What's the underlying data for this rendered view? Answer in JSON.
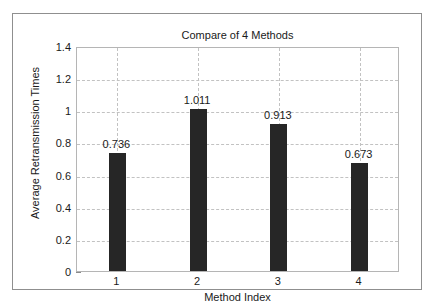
{
  "chart_data": {
    "type": "bar",
    "title": "Compare of 4 Methods",
    "xlabel": "Method Index",
    "ylabel": "Average Retransmission Times",
    "categories": [
      "1",
      "2",
      "3",
      "4"
    ],
    "values": [
      0.736,
      1.011,
      0.913,
      0.673
    ],
    "data_labels": [
      "0.736",
      "1.011",
      "0.913",
      "0.673"
    ],
    "ylim": [
      0,
      1.4
    ],
    "xlim": [
      0.5,
      4.5
    ],
    "ytick_labels": [
      "0",
      "0.2",
      "0.4",
      "0.6",
      "0.8",
      "1",
      "1.2",
      "1.4"
    ],
    "ytick_values": [
      0,
      0.2,
      0.4,
      0.6,
      0.8,
      1,
      1.2,
      1.4
    ],
    "xtick_labels": [
      "1",
      "2",
      "3",
      "4"
    ],
    "xtick_values": [
      1,
      2,
      3,
      4
    ],
    "grid": true,
    "grid_style": "dashed",
    "legend": null,
    "bar_color": "#262626",
    "grid_color": "#c2c2c2",
    "axes_color": "#b5b5b5",
    "frame_color": "#8f8f8f",
    "background_color": "#ffffff",
    "text_color": "#1a1a1a"
  }
}
